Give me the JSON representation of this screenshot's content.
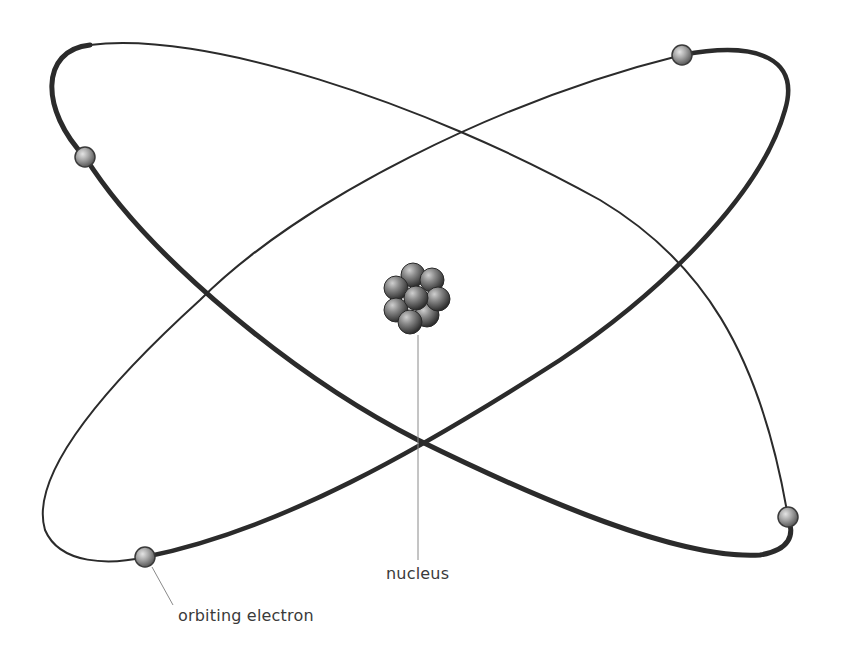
{
  "diagram": {
    "labels": {
      "nucleus": "nucleus",
      "electron": "orbiting electron"
    },
    "colors": {
      "orbit": "#2b2b2b",
      "leader_line": "#8a8a8a",
      "label_text": "#3a3a3a",
      "background": "#ffffff"
    },
    "orbits": [
      {
        "name": "orbit-a",
        "description": "ellipse from top-left to bottom-right"
      },
      {
        "name": "orbit-b",
        "description": "ellipse from top-right to bottom-left"
      }
    ],
    "electrons": [
      {
        "name": "electron-top-left",
        "x": 85,
        "y": 157
      },
      {
        "name": "electron-top-right",
        "x": 682,
        "y": 55
      },
      {
        "name": "electron-bottom-right",
        "x": 788,
        "y": 517
      },
      {
        "name": "electron-bottom-left",
        "x": 145,
        "y": 557
      }
    ],
    "nucleus": {
      "x": 417,
      "y": 298,
      "particle_count": 9
    }
  }
}
